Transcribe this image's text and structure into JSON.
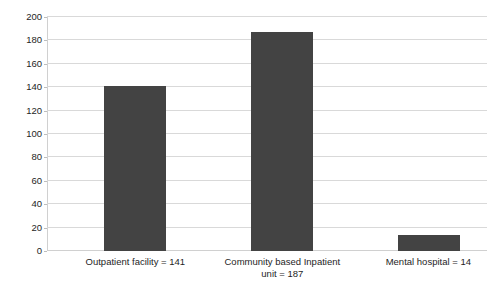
{
  "chart_data": {
    "type": "bar",
    "title": "",
    "subtitle": "",
    "xlabel": "",
    "ylabel": "",
    "categories": [
      "Outpatient facility = 141",
      "Community based Inpatient\nunit = 187",
      "Mental hospital = 14"
    ],
    "values": [
      141,
      187,
      14
    ],
    "ylim": [
      0,
      200
    ],
    "yticks": [
      0,
      20,
      40,
      60,
      80,
      100,
      120,
      140,
      160,
      180,
      200
    ],
    "ytick_labels": [
      "0",
      "20",
      "40",
      "60",
      "80",
      "100",
      "120",
      "140",
      "160",
      "180",
      "200"
    ],
    "grid": true,
    "grid_axis": "y",
    "legend": "none",
    "series": [
      {
        "name": "Facilities",
        "values": [
          141,
          187,
          14
        ]
      }
    ]
  },
  "style": {
    "bar_color": "#434343",
    "grid_color": "#d9d9d9",
    "axis_color": "#d0d0d0",
    "text_color": "#1e1e1e",
    "background": "#ffffff"
  }
}
